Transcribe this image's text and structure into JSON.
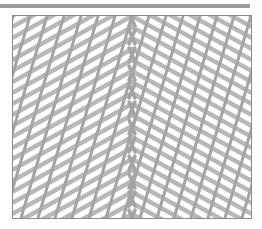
{
  "image": {
    "subject": "lace knitting stitch pattern",
    "description": "Grayscale photo of an openwork lace knit fabric with diagonal eyelet rows converging into a central V (chevron) spine",
    "colors": {
      "yarn": "#b8b8b8",
      "yarn_shadow": "#a4a4a4",
      "holes": "#ffffff",
      "frame_border": "#8a8a8a",
      "top_bar": "#9b9b9b"
    }
  }
}
